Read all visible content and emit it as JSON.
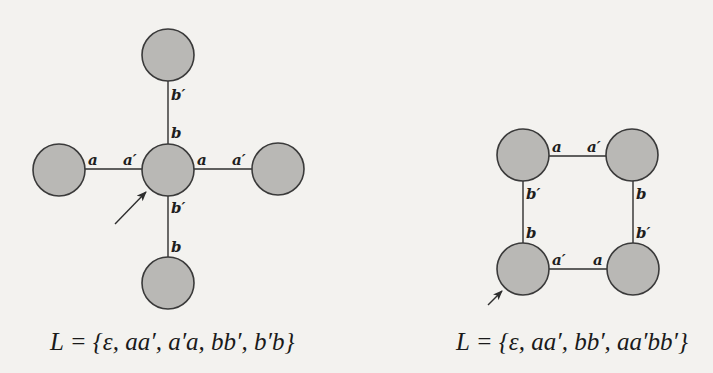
{
  "colors": {
    "background": "#f3f2ef",
    "node_fill": "#b9b8b5",
    "node_stroke": "#3a3a3a",
    "edge": "#2e2e2e",
    "text": "#1a1a1a"
  },
  "diagrams": [
    {
      "name": "star-diagram",
      "caption": "L = {ε, aa′, a′a, bb′, b′b}",
      "nodes": [
        {
          "id": "top",
          "cx": 168,
          "cy": 55
        },
        {
          "id": "left",
          "cx": 59,
          "cy": 170
        },
        {
          "id": "center",
          "cx": 168,
          "cy": 170
        },
        {
          "id": "right",
          "cx": 278,
          "cy": 169
        },
        {
          "id": "bottom",
          "cx": 168,
          "cy": 283
        }
      ],
      "edges": [
        {
          "from": "top",
          "to": "center",
          "labels": [
            "b′",
            "b"
          ]
        },
        {
          "from": "left",
          "to": "center",
          "labels": [
            "a",
            "a′"
          ]
        },
        {
          "from": "center",
          "to": "right",
          "labels": [
            "a",
            "a′"
          ]
        },
        {
          "from": "center",
          "to": "bottom",
          "labels": [
            "b′",
            "b"
          ]
        }
      ],
      "start_node": "center",
      "labels": {
        "top_b_prime": "b′",
        "center_b_top": "b",
        "left_a": "a",
        "center_a_prime_left": "a′",
        "center_a_right": "a",
        "right_a_prime": "a′",
        "center_b_prime_bottom": "b′",
        "bottom_b": "b"
      }
    },
    {
      "name": "square-diagram",
      "caption": "L = {ε, aa′, bb′, aa′bb′}",
      "nodes": [
        {
          "id": "top-left",
          "cx": 523,
          "cy": 155
        },
        {
          "id": "top-right",
          "cx": 632,
          "cy": 155
        },
        {
          "id": "bottom-left",
          "cx": 523,
          "cy": 269
        },
        {
          "id": "bottom-right",
          "cx": 633,
          "cy": 269
        }
      ],
      "edges": [
        {
          "from": "top-left",
          "to": "top-right",
          "labels": [
            "a",
            "a′"
          ]
        },
        {
          "from": "top-left",
          "to": "bottom-left",
          "labels": [
            "b′",
            "b"
          ]
        },
        {
          "from": "top-right",
          "to": "bottom-right",
          "labels": [
            "b",
            "b′"
          ]
        },
        {
          "from": "bottom-left",
          "to": "bottom-right",
          "labels": [
            "a′",
            "a"
          ]
        }
      ],
      "start_node": "bottom-left",
      "labels": {
        "tl_a": "a",
        "tr_a_prime": "a′",
        "tl_b_prime": "b′",
        "bl_b": "b",
        "tr_b": "b",
        "br_b_prime": "b′",
        "bl_a_prime": "a′",
        "br_a": "a"
      }
    }
  ]
}
